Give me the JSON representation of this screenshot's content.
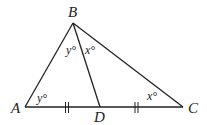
{
  "diagram": {
    "type": "triangle",
    "points": {
      "A": {
        "label": "A",
        "x": 25,
        "y": 107
      },
      "B": {
        "label": "B",
        "x": 73,
        "y": 23
      },
      "C": {
        "label": "C",
        "x": 183,
        "y": 107
      },
      "D": {
        "label": "D",
        "x": 100,
        "y": 107
      }
    },
    "segments": [
      "AB",
      "BC",
      "AC",
      "BD"
    ],
    "congruence_marks": {
      "AD": "||",
      "DC": "||"
    },
    "angle_labels": {
      "angle_A": "y°",
      "angle_ABD": "y°",
      "angle_DBC": "x°",
      "angle_C": "x°"
    },
    "colors": {
      "stroke": "#222222",
      "background": "#ffffff"
    }
  }
}
